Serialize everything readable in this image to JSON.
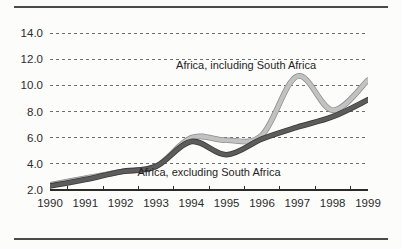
{
  "figure": {
    "background_color": "#fcfcfb",
    "rule_color": "#4a4a4a"
  },
  "chart_data": {
    "type": "line",
    "title": "",
    "subtitle": "",
    "xlabel": "",
    "ylabel": "",
    "grid": "horizontal-dashed",
    "legend_position": "inline-annotations",
    "x": [
      1990,
      1991,
      1992,
      1993,
      1994,
      1995,
      1996,
      1997,
      1998,
      1999
    ],
    "categories": [
      "1990",
      "1991",
      "1992",
      "1993",
      "1994",
      "1995",
      "1996",
      "1997",
      "1998",
      "1999"
    ],
    "xlim": [
      1990,
      1999
    ],
    "ylim": [
      2.0,
      14.0
    ],
    "ytick_labels": [
      "14.0",
      "12.0",
      "10.0",
      "8.0",
      "6.0",
      "4.0",
      "2.0"
    ],
    "ytick_values": [
      14.0,
      12.0,
      10.0,
      8.0,
      6.0,
      4.0,
      2.0
    ],
    "series": [
      {
        "name": "Africa, including South Africa",
        "color": "#c2c2c2",
        "edge_color": "#8a8a8a",
        "values": [
          2.4,
          2.9,
          3.4,
          3.8,
          6.0,
          5.8,
          6.2,
          10.7,
          8.1,
          10.4
        ]
      },
      {
        "name": "Africa, excluding South Africa",
        "color": "#5c5c5c",
        "edge_color": "#3a3a3a",
        "values": [
          2.3,
          2.8,
          3.4,
          3.8,
          5.7,
          4.7,
          5.9,
          6.8,
          7.6,
          8.9
        ]
      }
    ],
    "annotations": [
      {
        "text": "Africa, including South Africa",
        "x": 1995.55,
        "y": 11.25
      },
      {
        "text": "Africa, excluding South Africa",
        "x": 1994.5,
        "y": 3.05
      }
    ]
  }
}
